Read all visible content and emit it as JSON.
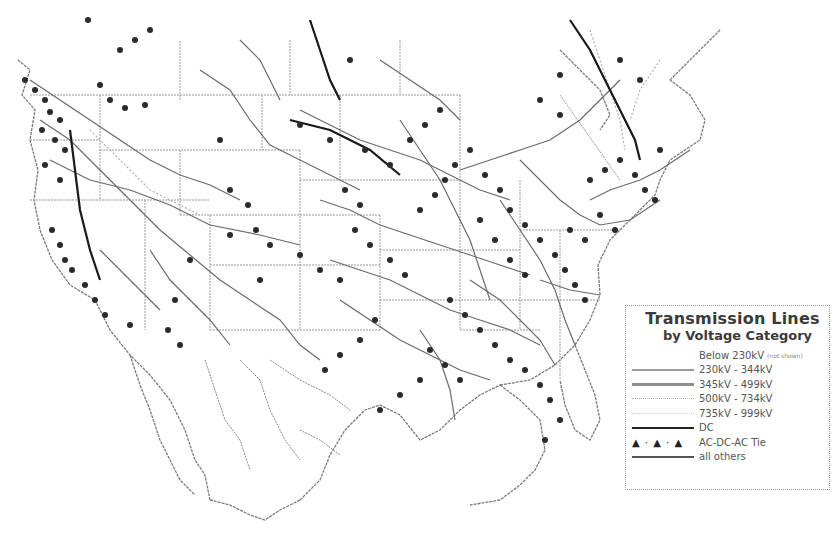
{
  "map": {
    "region": "North America (US, southern Canada, northern Mexico)",
    "style": "grayscale line map with substations as dots"
  },
  "legend": {
    "title": "Transmission Lines",
    "subtitle": "by Voltage Category",
    "items": [
      {
        "label": "Below 230kV",
        "note": "(not shown)",
        "style": "none"
      },
      {
        "label": "230kV - 344kV",
        "style": "solid-gray"
      },
      {
        "label": "345kV - 499kV",
        "style": "solid-gray-thick"
      },
      {
        "label": "500kV - 734kV",
        "style": "dotted-light"
      },
      {
        "label": "735kV - 999kV",
        "style": "dotted-lighter"
      },
      {
        "label": "DC",
        "style": "solid-black"
      },
      {
        "label": "AC-DC-AC Tie",
        "style": "triangles",
        "symbol": "▲ · ▲ · ▲"
      },
      {
        "label": "all others",
        "style": "solid-dark"
      }
    ]
  },
  "colors": {
    "background": "#ffffff",
    "lines": "#555555",
    "boundaries": "#8a8a8a",
    "dc_lines": "#1a1a1a",
    "substations": "#2a2a2a"
  }
}
